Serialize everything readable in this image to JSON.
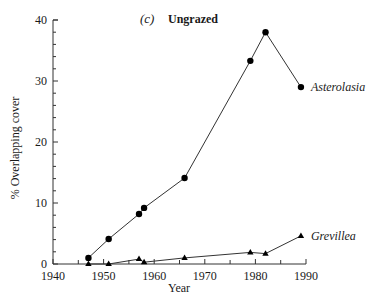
{
  "chart_data": {
    "type": "line",
    "title": "Ungrazed",
    "panel_label": "(c)",
    "xlabel": "Year",
    "ylabel": "% Overlapping cover",
    "xlim": [
      1940,
      1990
    ],
    "ylim": [
      0,
      40
    ],
    "x_ticks": [
      1940,
      1950,
      1960,
      1970,
      1980,
      1990
    ],
    "x_minor_step": 5,
    "y_ticks": [
      0,
      10,
      20,
      30,
      40
    ],
    "y_minor_step": 2,
    "grid": false,
    "legend_position": "inline labels at series end",
    "series": [
      {
        "name": "Asterolasia",
        "marker": "circle",
        "x": [
          1947,
          1951,
          1957,
          1958,
          1966,
          1979,
          1982,
          1989
        ],
        "values": [
          1.0,
          4.1,
          8.2,
          9.2,
          14.1,
          33.3,
          38.0,
          29.0
        ]
      },
      {
        "name": "Grevillea",
        "marker": "triangle",
        "x": [
          1947,
          1951,
          1957,
          1958,
          1966,
          1979,
          1982,
          1989
        ],
        "values": [
          0.0,
          0.0,
          0.8,
          0.3,
          1.0,
          1.9,
          1.7,
          4.6
        ]
      }
    ]
  },
  "style": {
    "line_color": "#333333",
    "marker_color": "#000000",
    "axis_color": "#333333"
  }
}
